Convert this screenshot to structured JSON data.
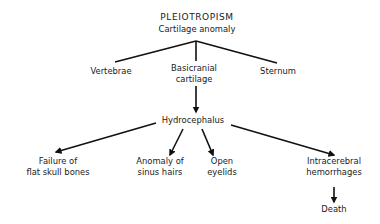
{
  "diagram": {
    "title": "PLEIOTROPISM",
    "root": "Cartilage anomaly",
    "level1": {
      "vertebrae": "Vertebrae",
      "basicranial_line1": "Basicranial",
      "basicranial_line2": "cartilage",
      "sternum": "Sternum"
    },
    "level2": {
      "hydrocephalus": "Hydrocephalus"
    },
    "level3": {
      "failure_line1": "Failure of",
      "failure_line2": "flat skull bones",
      "anomaly_line1": "Anomaly of",
      "anomaly_line2": "sinus hairs",
      "open_line1": "Open",
      "open_line2": "eyelids",
      "intracerebral_line1": "Intracerebral",
      "intracerebral_line2": "hemorrhages"
    },
    "level4": {
      "death": "Death"
    },
    "colors": {
      "ink": "#111111",
      "background": "#ffffff"
    }
  }
}
